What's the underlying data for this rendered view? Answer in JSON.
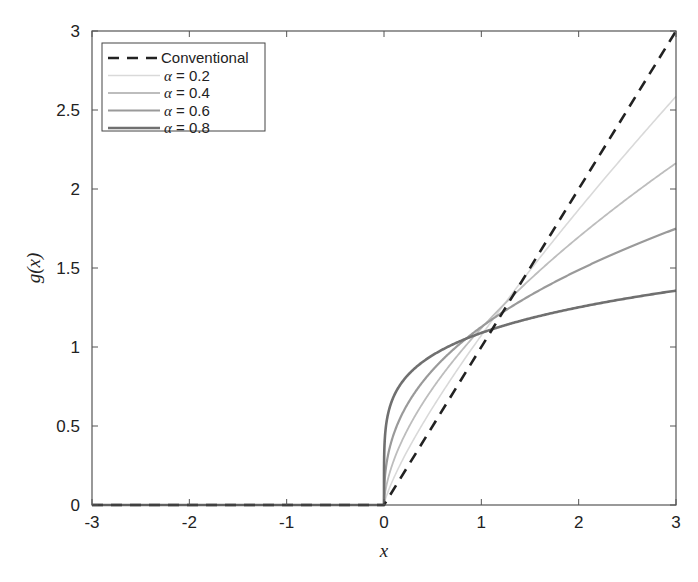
{
  "chart_data": {
    "type": "line",
    "title": "",
    "xlabel": "x",
    "ylabel": "g(x)",
    "xlim": [
      -3,
      3
    ],
    "ylim": [
      0,
      3
    ],
    "xticks": [
      -3,
      -2,
      -1,
      0,
      1,
      2,
      3
    ],
    "xtick_labels": [
      "-3",
      "-2",
      "-1",
      "0",
      "1",
      "2",
      "3"
    ],
    "yticks": [
      0,
      0.5,
      1,
      1.5,
      2,
      2.5,
      3
    ],
    "ytick_labels": [
      "0",
      "0.5",
      "1",
      "1.5",
      "2",
      "2.5",
      "3"
    ],
    "grid": false,
    "legend_position": "upper left",
    "function_note": "For x<=0 all curves are 0; for x>0 curves follow x^(1-alpha)/Gamma(2-alpha); conventional is g(x)=max(x,0)",
    "series": [
      {
        "name": "Conventional",
        "style": "dashed",
        "color": "#222222",
        "width": 2.6,
        "x": [
          -3,
          0,
          3
        ],
        "y": [
          0,
          0,
          3
        ]
      },
      {
        "name": "α = 0.2",
        "style": "solid",
        "color": "#d9d9d9",
        "width": 1.6,
        "x": [
          -3,
          0,
          0.5,
          1,
          1.5,
          2,
          2.5,
          3
        ],
        "y": [
          0,
          0,
          0.61,
          1.07,
          1.49,
          1.87,
          2.24,
          2.59
        ]
      },
      {
        "name": "α = 0.4",
        "style": "solid",
        "color": "#bdbdbd",
        "width": 1.8,
        "x": [
          -3,
          0,
          0.5,
          1,
          1.5,
          2,
          2.5,
          3
        ],
        "y": [
          0,
          0,
          0.74,
          1.12,
          1.43,
          1.7,
          1.94,
          2.16
        ]
      },
      {
        "name": "α = 0.6",
        "style": "solid",
        "color": "#9a9a9a",
        "width": 2.2,
        "x": [
          -3,
          0,
          0.5,
          1,
          1.5,
          2,
          2.5,
          3
        ],
        "y": [
          0,
          0,
          0.85,
          1.13,
          1.33,
          1.49,
          1.62,
          1.75
        ]
      },
      {
        "name": "α = 0.8",
        "style": "solid",
        "color": "#707070",
        "width": 2.6,
        "x": [
          -3,
          0,
          0.5,
          1,
          1.5,
          2,
          2.5,
          3
        ],
        "y": [
          0,
          0,
          0.95,
          1.09,
          1.18,
          1.25,
          1.31,
          1.36
        ]
      }
    ]
  },
  "legend": {
    "entries": [
      {
        "label": "Conventional"
      },
      {
        "greek": "α",
        "label": " = 0.2"
      },
      {
        "greek": "α",
        "label": " = 0.4"
      },
      {
        "greek": "α",
        "label": " = 0.6"
      },
      {
        "greek": "α",
        "label": " = 0.8"
      }
    ]
  }
}
